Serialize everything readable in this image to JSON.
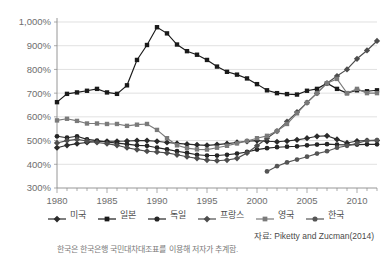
{
  "chart_data": {
    "type": "line",
    "title": "",
    "xlabel": "",
    "ylabel": "",
    "xlim": [
      1980,
      2012
    ],
    "ylim": [
      300,
      1000
    ],
    "yticks": [
      300,
      400,
      500,
      600,
      700,
      800,
      900,
      1000
    ],
    "ytick_labels": [
      "300%",
      "400%",
      "500%",
      "600%",
      "700%",
      "800%",
      "900%",
      "1,000%"
    ],
    "xticks": [
      1980,
      1985,
      1990,
      1995,
      2000,
      2005,
      2010
    ],
    "xtick_labels": [
      "1980",
      "1985",
      "1990",
      "1995",
      "2000",
      "2005",
      "2010"
    ],
    "x_minor_tick_step": 1,
    "grid": "horizontal",
    "legend_position": "bottom",
    "x": [
      1980,
      1981,
      1982,
      1983,
      1984,
      1985,
      1986,
      1987,
      1988,
      1989,
      1990,
      1991,
      1992,
      1993,
      1994,
      1995,
      1996,
      1997,
      1998,
      1999,
      2000,
      2001,
      2002,
      2003,
      2004,
      2005,
      2006,
      2007,
      2008,
      2009,
      2010,
      2011,
      2012
    ],
    "series": [
      {
        "name": "미국",
        "marker": "diamond",
        "color": "#2b2b2b",
        "values": [
          470,
          480,
          487,
          492,
          496,
          497,
          497,
          498,
          500,
          500,
          497,
          492,
          488,
          485,
          482,
          480,
          483,
          487,
          492,
          497,
          500,
          497,
          495,
          498,
          503,
          510,
          518,
          520,
          505,
          490,
          498,
          500,
          500
        ]
      },
      {
        "name": "일본",
        "marker": "square",
        "color": "#1a1a1a",
        "values": [
          662,
          697,
          703,
          710,
          718,
          703,
          697,
          733,
          840,
          903,
          978,
          952,
          905,
          877,
          862,
          840,
          812,
          790,
          778,
          762,
          738,
          712,
          700,
          696,
          694,
          710,
          718,
          742,
          718,
          700,
          712,
          708,
          712
        ]
      },
      {
        "name": "독일",
        "marker": "circle",
        "color": "#262626",
        "values": [
          518,
          512,
          518,
          505,
          500,
          494,
          489,
          485,
          480,
          478,
          470,
          463,
          455,
          448,
          440,
          437,
          437,
          440,
          445,
          452,
          462,
          468,
          472,
          474,
          476,
          480,
          483,
          485,
          483,
          482,
          483,
          484,
          484
        ]
      },
      {
        "name": "프랑스",
        "marker": "diamond",
        "color": "#4d4d4d",
        "values": [
          490,
          500,
          505,
          498,
          492,
          487,
          480,
          470,
          462,
          455,
          452,
          448,
          440,
          432,
          425,
          418,
          415,
          418,
          425,
          448,
          478,
          510,
          540,
          580,
          620,
          660,
          700,
          742,
          772,
          800,
          845,
          880,
          920
        ]
      },
      {
        "name": "영국",
        "marker": "square",
        "color": "#7a7a7a",
        "values": [
          585,
          592,
          583,
          572,
          572,
          570,
          570,
          562,
          567,
          570,
          545,
          510,
          480,
          468,
          463,
          462,
          470,
          478,
          488,
          498,
          510,
          520,
          540,
          570,
          615,
          660,
          700,
          742,
          760,
          700,
          718,
          700,
          700
        ]
      },
      {
        "name": "한국",
        "marker": "circle",
        "color": "#555555",
        "values": [
          null,
          null,
          null,
          null,
          null,
          null,
          null,
          null,
          null,
          null,
          null,
          null,
          null,
          null,
          null,
          null,
          null,
          null,
          null,
          null,
          null,
          370,
          392,
          408,
          420,
          432,
          445,
          455,
          470,
          478,
          488,
          500,
          502
        ]
      }
    ]
  },
  "footer": {
    "source": "자료: Piketty and Zucman(2014)",
    "note": "한국은 한국은행 국민대차대조표를 이용해 저자가 추계함."
  }
}
